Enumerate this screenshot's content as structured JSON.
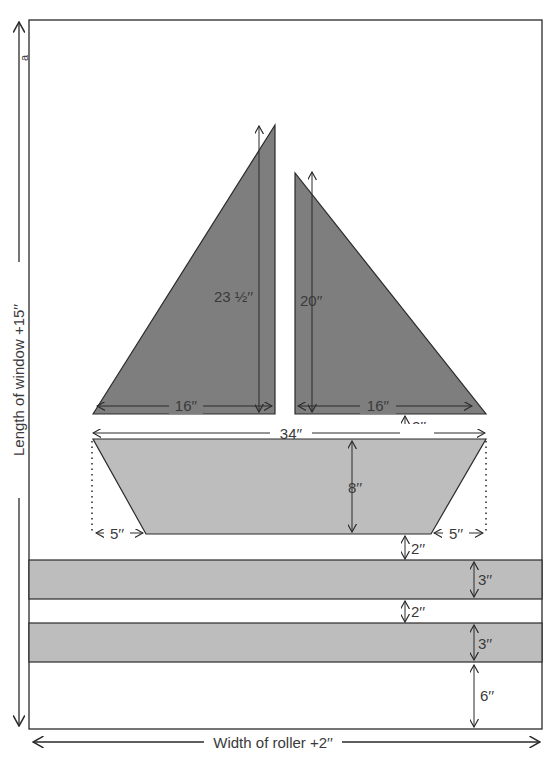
{
  "diagram": {
    "colors": {
      "background": "#ffffff",
      "sail_fill": "#7e7e7e",
      "hull_fill": "#bdbdbd",
      "stripe_fill": "#bdbdbd",
      "outline": "#2a2a2a",
      "text": "#3a3a3a"
    },
    "outer_panel": {
      "length_label": "Length of window +15′′",
      "width_label": "Width of roller +2′′",
      "corner_mark": "a"
    },
    "left_sail": {
      "height_label": "23 ½′′",
      "base_label": "16′′"
    },
    "right_sail": {
      "height_label": "20′′",
      "base_label": "16′′"
    },
    "sail_to_hull_gap_label": "2′′",
    "hull": {
      "top_width_label": "34′′",
      "height_label": "8′′",
      "left_inset_label": "5′′",
      "right_inset_label": "5′′"
    },
    "hull_to_stripe_gap_label": "2′′",
    "stripes": [
      {
        "name": "upper-stripe",
        "height_label": "3′′"
      },
      {
        "name": "lower-stripe",
        "height_label": "3′′"
      }
    ],
    "stripe_gap_label": "2′′",
    "bottom_margin_label": "6′′"
  }
}
